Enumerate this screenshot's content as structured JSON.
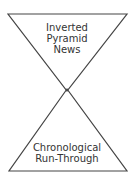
{
  "diagram": {
    "top_shape": {
      "type": "inverted-triangle",
      "lines": [
        "Inverted",
        "Pyramid",
        "News"
      ]
    },
    "bottom_shape": {
      "type": "upright-triangle",
      "lines": [
        "Chronological",
        "Run-Through"
      ]
    },
    "colors": {
      "stroke": "#444444",
      "text": "#333333",
      "background": "#ffffff"
    }
  }
}
